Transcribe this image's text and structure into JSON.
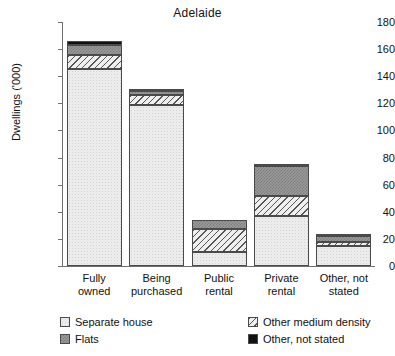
{
  "chart_data": {
    "type": "bar",
    "subtype": "stacked-vertical",
    "title": "Adelaide",
    "xlabel": "",
    "ylabel": "Dwellings ('000)",
    "ylim": [
      0,
      180
    ],
    "ytick_step": 20,
    "yticks": [
      0,
      20,
      40,
      60,
      80,
      100,
      120,
      140,
      160,
      180
    ],
    "ytick_labels": [
      "0",
      "20",
      "40",
      "60",
      "80",
      "100",
      "120",
      "140",
      "160",
      "180"
    ],
    "grid": false,
    "legend_position": "bottom",
    "categories": [
      "Fully owned",
      "Being purchased",
      "Public rental",
      "Private rental",
      "Other, not stated"
    ],
    "category_lines": [
      [
        "Fully",
        "owned"
      ],
      [
        "Being",
        "purchased"
      ],
      [
        "Public",
        "rental"
      ],
      [
        "Private",
        "rental"
      ],
      [
        "Other, not",
        "stated"
      ]
    ],
    "series": [
      {
        "name": "Separate house",
        "pattern": "light-dotted",
        "color": "#ececec",
        "values": [
          145,
          119,
          10,
          37,
          15
        ]
      },
      {
        "name": "Other medium density",
        "pattern": "diagonal-hatch",
        "color": "#efefef",
        "values": [
          11,
          7,
          17,
          15,
          3
        ]
      },
      {
        "name": "Flats",
        "pattern": "grey-checker",
        "color": "#9a9a9a",
        "values": [
          7,
          3,
          7,
          21.5,
          4.5
        ]
      },
      {
        "name": "Other, not stated",
        "pattern": "solid-black",
        "color": "#111111",
        "values": [
          3,
          1,
          0,
          1,
          0.5
        ]
      }
    ],
    "totals": [
      166,
      130,
      34,
      74.5,
      23
    ]
  },
  "legend": {
    "items": [
      {
        "label": "Separate house",
        "swatch": "light-dotted"
      },
      {
        "label": "Flats",
        "swatch": "grey-checker"
      },
      {
        "label": "Other medium density",
        "swatch": "diagonal-hatch"
      },
      {
        "label": "Other, not stated",
        "swatch": "solid-black"
      }
    ]
  }
}
